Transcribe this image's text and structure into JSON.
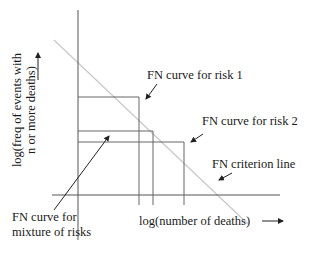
{
  "diagram": {
    "y_axis_label": {
      "line1": "log(freq of events with",
      "line2": "n or more deaths)"
    },
    "x_axis_label": "log(number of deaths)",
    "labels": {
      "risk1": "FN curve for risk 1",
      "risk2": "FN curve for risk 2",
      "criterion": "FN criterion line",
      "mixture_line1": "FN curve for",
      "mixture_line2": "mixture of risks"
    },
    "colors": {
      "axis": "#555555",
      "curve": "#666666",
      "criterion": "#c8c8c8",
      "text": "#1a1a1a"
    }
  }
}
